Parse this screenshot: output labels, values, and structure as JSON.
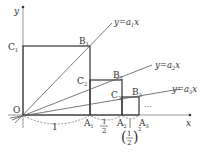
{
  "diagram": {
    "axes": {
      "x_label": "x",
      "y_label": "y",
      "origin_label": "O"
    },
    "lines": [
      {
        "label_prefix": "y=a",
        "sub": "1",
        "suffix": "x"
      },
      {
        "label_prefix": "y=a",
        "sub": "2",
        "suffix": "x"
      },
      {
        "label_prefix": "y=a",
        "sub": "3",
        "suffix": "x"
      }
    ],
    "points": {
      "A1": {
        "base": "A",
        "sub": "1"
      },
      "A2": {
        "base": "A",
        "sub": "2"
      },
      "A3": {
        "base": "A",
        "sub": "3"
      },
      "B1": {
        "base": "B",
        "sub": "1"
      },
      "B2": {
        "base": "B",
        "sub": "2"
      },
      "B3": {
        "base": "B",
        "sub": "3"
      },
      "C1": {
        "base": "C",
        "sub": "1"
      },
      "C2": {
        "base": "C",
        "sub": "2"
      },
      "C3": {
        "base": "C",
        "sub": "3"
      }
    },
    "lengths": {
      "first": "1",
      "second_num": "1",
      "second_den": "2",
      "third_num": "1",
      "third_den": "2",
      "third_exp": "2"
    },
    "ellipsis": "···"
  }
}
